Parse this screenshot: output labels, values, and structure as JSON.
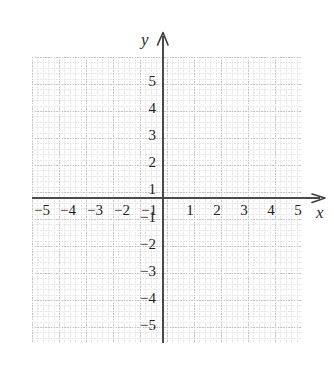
{
  "chart_data": {
    "type": "scatter",
    "title": "",
    "subtitle": "",
    "xlabel": "x",
    "ylabel": "y",
    "xlim": [
      -5.8,
      6.2
    ],
    "ylim": [
      -5.8,
      6.2
    ],
    "grid": true,
    "legend": null,
    "series": [],
    "annotations": [],
    "x_ticks": [
      -5,
      -4,
      -3,
      -2,
      -1,
      1,
      2,
      3,
      4,
      5
    ],
    "y_ticks": [
      5,
      4,
      3,
      2,
      1,
      -1,
      -2,
      -3,
      -4,
      -5
    ],
    "x_tick_labels": [
      "−5",
      "−4",
      "−3",
      "−2",
      "−1",
      "1",
      "2",
      "3",
      "4",
      "5"
    ],
    "y_tick_labels": [
      "5",
      "4",
      "3",
      "2",
      "1",
      "−1",
      "−2",
      "−3",
      "−4",
      "−5"
    ],
    "major_grid_step": 1,
    "minor_grid_divisions": 5,
    "axis_color": "#4a4a4a",
    "grid_color": "#d3d3d3",
    "background_color": "#ffffff"
  },
  "axes": {
    "x_name": "x",
    "y_name": "y",
    "x_arrow_icon": "arrow-right-icon",
    "y_arrow_icon": "arrow-up-icon"
  },
  "ticks": {
    "x_negative": [
      {
        "label": "−5",
        "left": 34
      },
      {
        "label": "−4",
        "left": 60
      },
      {
        "label": "−3",
        "left": 87
      },
      {
        "label": "−2",
        "left": 114
      },
      {
        "label": "−1",
        "left": 141
      }
    ],
    "x_positive": [
      {
        "label": "1",
        "left": 182
      },
      {
        "label": "2",
        "left": 209
      },
      {
        "label": "3",
        "left": 236
      },
      {
        "label": "4",
        "left": 263
      },
      {
        "label": "5",
        "left": 290
      }
    ],
    "y_positive": [
      {
        "label": "5",
        "top": 74
      },
      {
        "label": "4",
        "top": 101
      },
      {
        "label": "3",
        "top": 128
      },
      {
        "label": "2",
        "top": 155
      },
      {
        "label": "1",
        "top": 182
      }
    ],
    "y_negative": [
      {
        "label": "−1",
        "top": 210
      },
      {
        "label": "−2",
        "top": 237
      },
      {
        "label": "−3",
        "top": 264
      },
      {
        "label": "−4",
        "top": 291
      },
      {
        "label": "−5",
        "top": 318
      }
    ]
  }
}
